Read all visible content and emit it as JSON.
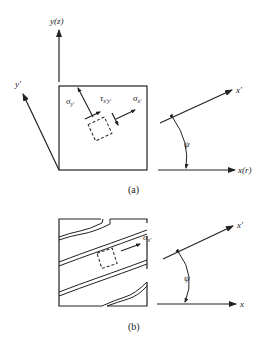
{
  "figure_a": {
    "caption": "(a)",
    "axis_vertical": "y(z)",
    "axis_rotated_y": "y'",
    "axis_rotated_x": "x'",
    "axis_horizontal": "x(r)",
    "angle": "ψ",
    "stress_normal_y_symbol": "σ",
    "stress_normal_y_sub": "y'",
    "stress_shear_symbol": "τ",
    "stress_shear_sub": "x'y'",
    "stress_normal_x_symbol": "σ",
    "stress_normal_x_sub": "x'"
  },
  "figure_b": {
    "caption": "(b)",
    "axis_rotated_x": "x'",
    "axis_horizontal": "x",
    "angle": "ψ",
    "stress_normal_x_symbol": "σ",
    "stress_normal_x_sub": "x'"
  }
}
